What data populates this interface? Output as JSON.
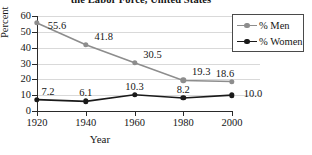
{
  "chart_data": {
    "type": "line",
    "title": "the Labor Force, United States",
    "xlabel": "Year",
    "ylabel": "Percent",
    "x": [
      1920,
      1940,
      1960,
      1980,
      2000
    ],
    "xtick_labels": [
      "1920",
      "1940",
      "1960",
      "1980",
      "2000"
    ],
    "ylim": [
      0,
      60
    ],
    "ytick_values": [
      0,
      10,
      20,
      30,
      40,
      50,
      60
    ],
    "ytick_labels": [
      "0",
      "10",
      "20",
      "30",
      "40",
      "50",
      "60"
    ],
    "grid": true,
    "legend_position": "right",
    "series": [
      {
        "name": "% Men",
        "color": "#8d8d8d",
        "values": [
          55.6,
          41.8,
          30.5,
          19.3,
          18.6
        ],
        "point_labels": [
          "55.6",
          "41.8",
          "30.5",
          "19.3",
          "18.6"
        ]
      },
      {
        "name": "% Women",
        "color": "#1a1a1a",
        "values": [
          7.2,
          6.1,
          10.3,
          8.2,
          10.0
        ],
        "point_labels": [
          "7.2",
          "6.1",
          "10.3",
          "8.2",
          "10.0"
        ]
      }
    ]
  },
  "legend": {
    "entries": [
      {
        "label": "% Men",
        "color": "#8d8d8d"
      },
      {
        "label": "% Women",
        "color": "#1a1a1a"
      }
    ]
  }
}
